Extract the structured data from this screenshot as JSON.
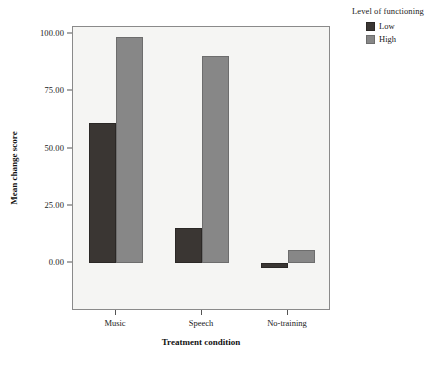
{
  "chart_data": {
    "type": "bar",
    "title": "",
    "xlabel": "Treatment condition",
    "ylabel": "Mean change score",
    "categories": [
      "Music",
      "Speech",
      "No-training"
    ],
    "series": [
      {
        "name": "Low",
        "color": "#3a3633",
        "values": [
          61,
          15.5,
          -2
        ]
      },
      {
        "name": "High",
        "color": "#878787",
        "values": [
          98.5,
          90.5,
          5.5
        ]
      }
    ],
    "ylim": [
      -5,
      108
    ],
    "yticks": [
      0,
      25,
      50,
      75,
      100
    ],
    "ytick_labels": [
      "0.00",
      "25.00",
      "50.00",
      "75.00",
      "100.00"
    ],
    "grid": false,
    "legend": {
      "title": "Level of functioning",
      "position": "right-top",
      "entries": [
        {
          "label": "Low",
          "color": "#3a3633"
        },
        {
          "label": "High",
          "color": "#878787"
        }
      ]
    },
    "plot_background": "#f5f5f3",
    "frame_color": "#8a8a8a"
  }
}
